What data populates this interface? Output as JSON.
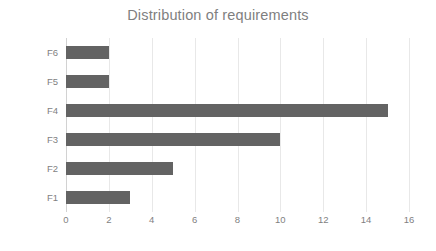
{
  "chart_data": {
    "type": "bar",
    "orientation": "horizontal",
    "title": "Distribution of requirements",
    "xlabel": "",
    "ylabel": "",
    "categories": [
      "F1",
      "F2",
      "F3",
      "F4",
      "F5",
      "F6"
    ],
    "values": [
      3,
      5,
      10,
      15,
      2,
      2
    ],
    "series": [
      {
        "name": "requirements",
        "values": [
          3,
          5,
          10,
          15,
          2,
          2
        ]
      }
    ],
    "xlim": [
      0,
      16
    ],
    "xticks": [
      0,
      2,
      4,
      6,
      8,
      10,
      12,
      14,
      16
    ],
    "xtick_labels": [
      "0",
      "2",
      "4",
      "6",
      "8",
      "10",
      "12",
      "14",
      "16"
    ],
    "ytick_labels_top_to_bottom": [
      "F6",
      "F5",
      "F4",
      "F3",
      "F2",
      "F1"
    ],
    "grid": "vertical-only",
    "legend": "none",
    "bar_color": "#636363",
    "text_color": "#7f7f7f",
    "gridline_color": "#e8e8e8",
    "axis_color": "#d2d2d2",
    "background": "#ffffff"
  }
}
